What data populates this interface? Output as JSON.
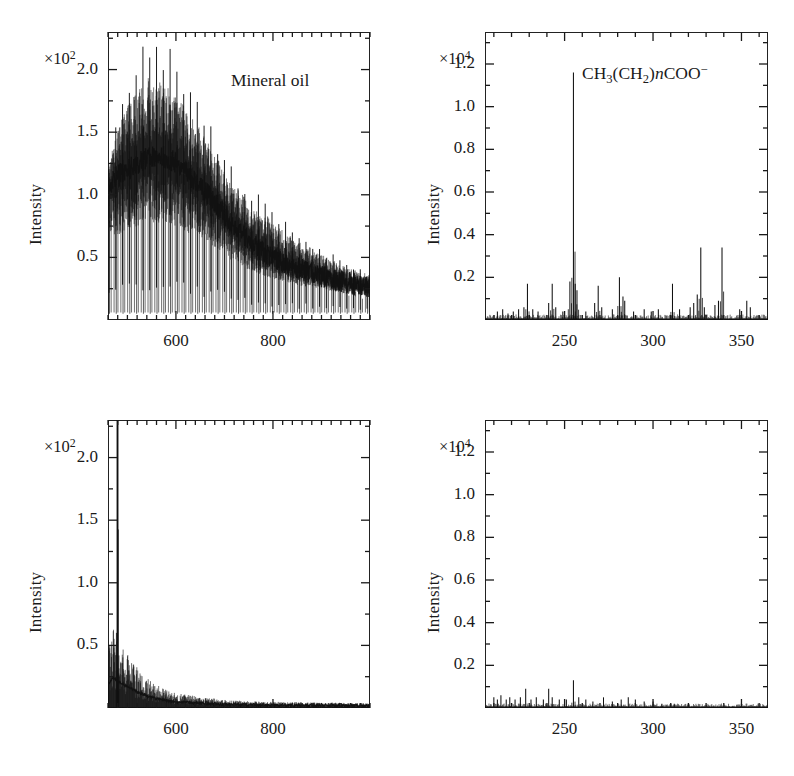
{
  "figure": {
    "background": "#ffffff",
    "ink": "#1a1a1a",
    "trace_color": "#111111"
  },
  "axis_titles": {
    "y": "Intensity",
    "x": "Mass/u"
  },
  "panels": [
    {
      "id": "top-left",
      "annotation": "Mineral oil",
      "annotation_html": "Mineral oil",
      "exponent_html": "×10<sup>2</sup>",
      "exponent_text": "×10²",
      "x_ticks": [
        600,
        800
      ],
      "y_ticks": [
        "0.5",
        "1.0",
        "1.5",
        "2.0"
      ]
    },
    {
      "id": "top-right",
      "annotation": "CH3(CH2)nCOO-",
      "annotation_html": "CH<sub>3</sub>(CH<sub>2</sub>)<i>n</i>COO<sup>−</sup>",
      "exponent_html": "×10<sup>4</sup>",
      "exponent_text": "×10⁴",
      "x_ticks": [
        250,
        300,
        350
      ],
      "y_ticks": [
        "0.2",
        "0.4",
        "0.6",
        "0.8",
        "1.0",
        "1.2"
      ]
    },
    {
      "id": "bottom-left",
      "annotation": "",
      "annotation_html": "",
      "exponent_html": "×10<sup>2</sup>",
      "exponent_text": "×10²",
      "x_ticks": [
        600,
        800
      ],
      "y_ticks": [
        "0.5",
        "1.0",
        "1.5",
        "2.0"
      ]
    },
    {
      "id": "bottom-right",
      "annotation": "",
      "annotation_html": "",
      "exponent_html": "×10<sup>4</sup>",
      "exponent_text": "×10⁴",
      "x_ticks": [
        250,
        300,
        350
      ],
      "y_ticks": [
        "0.2",
        "0.4",
        "0.6",
        "0.8",
        "1.0",
        "1.2"
      ]
    }
  ],
  "chart_data": [
    {
      "type": "line",
      "panel": "top-left",
      "title": "Mineral oil",
      "xlabel": "Mass/u",
      "ylabel": "Intensity",
      "y_scale_exponent": 2,
      "xlim": [
        460,
        1000
      ],
      "ylim": [
        0,
        2.3
      ],
      "xticks_major": [
        600,
        800
      ],
      "xtick_interval_minor": 20,
      "yticks": [
        0.5,
        1.0,
        1.5,
        2.0
      ],
      "grid": false,
      "legend": "none",
      "description": "Dense polymeric comb of alkane oligomer peaks spaced 14 u apart; envelope rises from ~1.1 at 470, maxima ~2.25 near 540-600, decaying steadily to ~0.3 at 990.",
      "envelope_x": [
        460,
        480,
        500,
        520,
        540,
        560,
        580,
        600,
        620,
        640,
        660,
        680,
        700,
        720,
        740,
        760,
        780,
        800,
        830,
        860,
        890,
        920,
        950,
        980,
        1000
      ],
      "envelope_top": [
        1.25,
        1.75,
        2.0,
        2.15,
        2.25,
        2.2,
        2.25,
        2.1,
        1.95,
        1.8,
        1.7,
        1.55,
        1.35,
        1.2,
        1.15,
        1.05,
        1.0,
        0.92,
        0.8,
        0.72,
        0.62,
        0.55,
        0.48,
        0.42,
        0.4
      ],
      "envelope_bottom": [
        0.5,
        0.42,
        0.45,
        0.48,
        0.5,
        0.48,
        0.5,
        0.47,
        0.45,
        0.42,
        0.4,
        0.38,
        0.35,
        0.3,
        0.28,
        0.26,
        0.25,
        0.24,
        0.22,
        0.2,
        0.2,
        0.18,
        0.16,
        0.15,
        0.14
      ],
      "comb_spacing": 14,
      "baseline_center": [
        1.05,
        1.15,
        1.2,
        1.25,
        1.3,
        1.3,
        1.3,
        1.25,
        1.18,
        1.1,
        1.02,
        0.95,
        0.85,
        0.75,
        0.68,
        0.6,
        0.55,
        0.5,
        0.44,
        0.4,
        0.36,
        0.33,
        0.3,
        0.28,
        0.26
      ]
    },
    {
      "type": "line",
      "panel": "top-right",
      "title": "CH3(CH2)nCOO-",
      "xlabel": "Mass/u",
      "ylabel": "Intensity",
      "y_scale_exponent": 4,
      "xlim": [
        205,
        365
      ],
      "ylim": [
        0,
        1.35
      ],
      "xticks_major": [
        250,
        300,
        350
      ],
      "xtick_interval_minor": 10,
      "yticks": [
        0.2,
        0.4,
        0.6,
        0.8,
        1.0,
        1.2
      ],
      "grid": false,
      "legend": "none",
      "description": "Sparse fatty-acid carboxylate mass spectrum with dominant peak at 255 u reaching 1.16, secondary peaks at 327 and 339 near 0.34, and numerous minor peaks below 0.2 on a low noise baseline.",
      "peaks": [
        {
          "mass": 212,
          "intensity": 0.04
        },
        {
          "mass": 215,
          "intensity": 0.05
        },
        {
          "mass": 218,
          "intensity": 0.03
        },
        {
          "mass": 221,
          "intensity": 0.04
        },
        {
          "mass": 224,
          "intensity": 0.05
        },
        {
          "mass": 227,
          "intensity": 0.06
        },
        {
          "mass": 229,
          "intensity": 0.17
        },
        {
          "mass": 232,
          "intensity": 0.05
        },
        {
          "mass": 235,
          "intensity": 0.04
        },
        {
          "mass": 241,
          "intensity": 0.08
        },
        {
          "mass": 243,
          "intensity": 0.17
        },
        {
          "mass": 245,
          "intensity": 0.06
        },
        {
          "mass": 249,
          "intensity": 0.04
        },
        {
          "mass": 253,
          "intensity": 0.18
        },
        {
          "mass": 255,
          "intensity": 1.16
        },
        {
          "mass": 256,
          "intensity": 0.17
        },
        {
          "mass": 257,
          "intensity": 0.14
        },
        {
          "mass": 262,
          "intensity": 0.04
        },
        {
          "mass": 267,
          "intensity": 0.08
        },
        {
          "mass": 269,
          "intensity": 0.16
        },
        {
          "mass": 271,
          "intensity": 0.06
        },
        {
          "mass": 277,
          "intensity": 0.05
        },
        {
          "mass": 281,
          "intensity": 0.2
        },
        {
          "mass": 283,
          "intensity": 0.11
        },
        {
          "mass": 284,
          "intensity": 0.09
        },
        {
          "mass": 289,
          "intensity": 0.04
        },
        {
          "mass": 295,
          "intensity": 0.05
        },
        {
          "mass": 299,
          "intensity": 0.04
        },
        {
          "mass": 303,
          "intensity": 0.05
        },
        {
          "mass": 311,
          "intensity": 0.17
        },
        {
          "mass": 315,
          "intensity": 0.05
        },
        {
          "mass": 321,
          "intensity": 0.06
        },
        {
          "mass": 323,
          "intensity": 0.08
        },
        {
          "mass": 325,
          "intensity": 0.12
        },
        {
          "mass": 327,
          "intensity": 0.34
        },
        {
          "mass": 329,
          "intensity": 0.06
        },
        {
          "mass": 335,
          "intensity": 0.07
        },
        {
          "mass": 337,
          "intensity": 0.09
        },
        {
          "mass": 339,
          "intensity": 0.34
        },
        {
          "mass": 349,
          "intensity": 0.05
        },
        {
          "mass": 353,
          "intensity": 0.09
        },
        {
          "mass": 355,
          "intensity": 0.06
        }
      ],
      "noise_level": 0.015
    },
    {
      "type": "line",
      "panel": "bottom-left",
      "title": "",
      "xlabel": "Mass/u",
      "ylabel": "Intensity",
      "y_scale_exponent": 2,
      "xlim": [
        460,
        1000
      ],
      "ylim": [
        0,
        2.3
      ],
      "xticks_major": [
        600,
        800
      ],
      "xtick_interval_minor": 20,
      "yticks": [
        0.5,
        1.0,
        1.5,
        2.0
      ],
      "grid": false,
      "legend": "none",
      "description": "Single intense spike near 480 u that clips above the top of the frame, with a rapidly decaying low-mass shoulder falling from ~0.55 at 470 to a flat near-zero baseline beyond 650 u.",
      "spike_mass": 480,
      "spike_clipped": true,
      "decay_x": [
        460,
        470,
        480,
        490,
        500,
        520,
        540,
        560,
        580,
        600,
        650,
        700,
        750,
        800,
        900,
        1000
      ],
      "decay_top": [
        0.42,
        0.58,
        0.5,
        0.45,
        0.4,
        0.3,
        0.22,
        0.17,
        0.13,
        0.11,
        0.08,
        0.06,
        0.05,
        0.045,
        0.04,
        0.035
      ],
      "noise_level": 0.02
    },
    {
      "type": "line",
      "panel": "bottom-right",
      "title": "",
      "xlabel": "Mass/u",
      "ylabel": "Intensity",
      "y_scale_exponent": 4,
      "xlim": [
        205,
        365
      ],
      "ylim": [
        0,
        1.35
      ],
      "xticks_major": [
        250,
        300,
        350
      ],
      "xtick_interval_minor": 10,
      "yticks": [
        0.2,
        0.4,
        0.6,
        0.8,
        1.0,
        1.2
      ],
      "grid": false,
      "legend": "none",
      "description": "Essentially flat spectrum with only low-level noise below 0.1; the tallest feature is a small peak at 255 u reaching about 0.13, all other signal hugs the baseline and fades out beyond 320 u.",
      "peaks": [
        {
          "mass": 210,
          "intensity": 0.05
        },
        {
          "mass": 212,
          "intensity": 0.04
        },
        {
          "mass": 214,
          "intensity": 0.06
        },
        {
          "mass": 217,
          "intensity": 0.04
        },
        {
          "mass": 219,
          "intensity": 0.05
        },
        {
          "mass": 222,
          "intensity": 0.04
        },
        {
          "mass": 225,
          "intensity": 0.05
        },
        {
          "mass": 228,
          "intensity": 0.09
        },
        {
          "mass": 231,
          "intensity": 0.04
        },
        {
          "mass": 234,
          "intensity": 0.05
        },
        {
          "mass": 238,
          "intensity": 0.04
        },
        {
          "mass": 241,
          "intensity": 0.09
        },
        {
          "mass": 243,
          "intensity": 0.05
        },
        {
          "mass": 247,
          "intensity": 0.04
        },
        {
          "mass": 251,
          "intensity": 0.04
        },
        {
          "mass": 255,
          "intensity": 0.13
        },
        {
          "mass": 258,
          "intensity": 0.05
        },
        {
          "mass": 262,
          "intensity": 0.04
        },
        {
          "mass": 266,
          "intensity": 0.03
        },
        {
          "mass": 272,
          "intensity": 0.05
        },
        {
          "mass": 277,
          "intensity": 0.03
        },
        {
          "mass": 282,
          "intensity": 0.04
        },
        {
          "mass": 286,
          "intensity": 0.05
        },
        {
          "mass": 290,
          "intensity": 0.04
        },
        {
          "mass": 295,
          "intensity": 0.03
        },
        {
          "mass": 300,
          "intensity": 0.03
        },
        {
          "mass": 305,
          "intensity": 0.02
        },
        {
          "mass": 312,
          "intensity": 0.02
        },
        {
          "mass": 320,
          "intensity": 0.02
        },
        {
          "mass": 330,
          "intensity": 0.015
        }
      ],
      "noise_level": 0.012
    }
  ]
}
